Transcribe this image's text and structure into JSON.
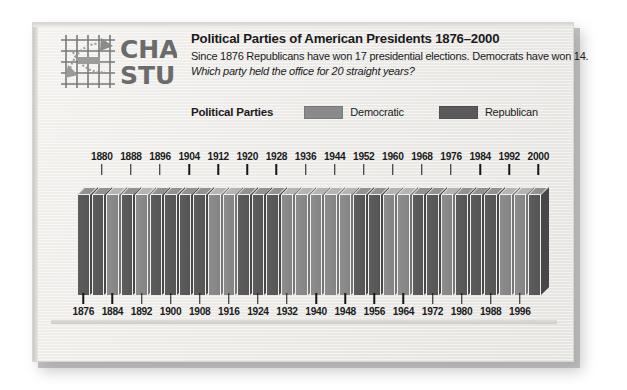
{
  "brand": {
    "logo_line1": "CHART",
    "logo_line2": "STUDY",
    "logo_icon": "grid-arrow-icon"
  },
  "header": {
    "title": "Political Parties of American Presidents 1876–2000",
    "subtitle": "Since 1876 Republicans have won 17 presidential elections. Democrats have won 14.",
    "question": "Which party held the office for 20 straight years?"
  },
  "legend": {
    "title": "Political Parties",
    "items": [
      {
        "label": "Democratic",
        "color": "#8a8a8a"
      },
      {
        "label": "Republican",
        "color": "#5a5a5a"
      }
    ]
  },
  "axis": {
    "top_labels": [
      "1880",
      "1888",
      "1896",
      "1904",
      "1912",
      "1920",
      "1928",
      "1936",
      "1944",
      "1952",
      "1960",
      "1968",
      "1976",
      "1984",
      "1992",
      "2000"
    ],
    "bottom_labels": [
      "1876",
      "1884",
      "1892",
      "1900",
      "1908",
      "1916",
      "1924",
      "1932",
      "1940",
      "1948",
      "1956",
      "1964",
      "1972",
      "1980",
      "1988",
      "1996"
    ]
  },
  "chart_data": {
    "type": "bar",
    "title": "Political Parties of American Presidents 1876–2000",
    "subtitle": "Since 1876 Republicans have won 17 presidential elections. Democrats have won 14.",
    "xlabel": "Presidential election year (4-year terms)",
    "ylabel": "",
    "grid": false,
    "legend_position": "top",
    "categories": [
      "1876",
      "1880",
      "1884",
      "1888",
      "1892",
      "1896",
      "1900",
      "1904",
      "1908",
      "1912",
      "1916",
      "1920",
      "1924",
      "1928",
      "1932",
      "1936",
      "1940",
      "1944",
      "1948",
      "1952",
      "1956",
      "1960",
      "1964",
      "1968",
      "1972",
      "1976",
      "1980",
      "1984",
      "1988",
      "1992",
      "1996",
      "2000"
    ],
    "values": [
      1,
      1,
      1,
      1,
      1,
      1,
      1,
      1,
      1,
      1,
      1,
      1,
      1,
      1,
      1,
      1,
      1,
      1,
      1,
      1,
      1,
      1,
      1,
      1,
      1,
      1,
      1,
      1,
      1,
      1,
      1,
      1
    ],
    "series": [
      {
        "name": "Party won",
        "parties": [
          "Republican",
          "Republican",
          "Democratic",
          "Republican",
          "Democratic",
          "Republican",
          "Republican",
          "Republican",
          "Republican",
          "Democratic",
          "Democratic",
          "Republican",
          "Republican",
          "Republican",
          "Democratic",
          "Democratic",
          "Democratic",
          "Democratic",
          "Democratic",
          "Republican",
          "Republican",
          "Democratic",
          "Democratic",
          "Republican",
          "Republican",
          "Democratic",
          "Republican",
          "Republican",
          "Republican",
          "Democratic",
          "Democratic",
          "Republican"
        ]
      }
    ],
    "counts": {
      "Republican": 17,
      "Democratic": 14
    },
    "annotations": [
      "Which party held the office for 20 straight years?"
    ]
  }
}
